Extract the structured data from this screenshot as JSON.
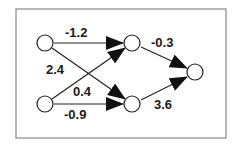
{
  "diagram": {
    "type": "neural-network",
    "frame_color": "#888888",
    "line_color": "#222222",
    "nodes": [
      {
        "id": "input-1",
        "x": 45,
        "y": 43
      },
      {
        "id": "input-2",
        "x": 45,
        "y": 104
      },
      {
        "id": "hidden-1",
        "x": 132,
        "y": 43
      },
      {
        "id": "hidden-2",
        "x": 132,
        "y": 104
      },
      {
        "id": "output",
        "x": 195,
        "y": 72
      }
    ],
    "edges": [
      {
        "from": "input-1",
        "to": "hidden-1",
        "weight": "-1.2"
      },
      {
        "from": "input-1",
        "to": "hidden-2",
        "weight": "2.4"
      },
      {
        "from": "input-2",
        "to": "hidden-1",
        "weight": "0.4"
      },
      {
        "from": "input-2",
        "to": "hidden-2",
        "weight": "-0.9"
      },
      {
        "from": "hidden-1",
        "to": "output",
        "weight": "-0.3"
      },
      {
        "from": "hidden-2",
        "to": "output",
        "weight": "3.6"
      }
    ]
  }
}
